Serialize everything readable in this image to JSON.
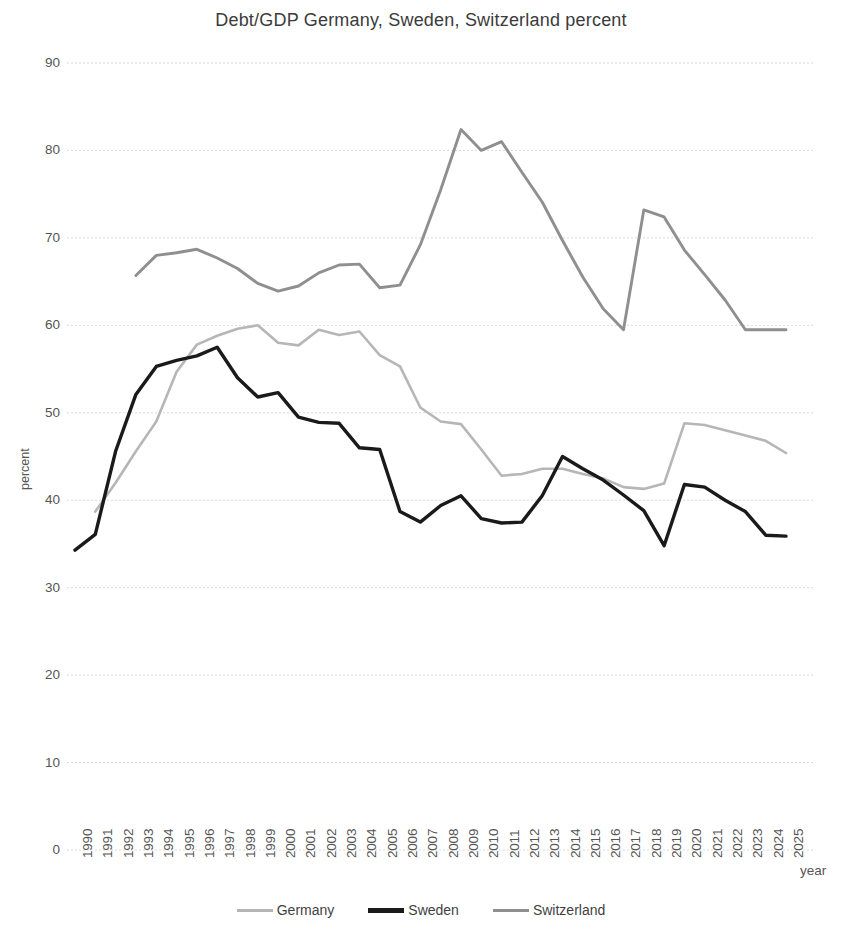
{
  "chart_data": {
    "type": "line",
    "title": "Debt/GDP Germany, Sweden, Switzerland percent",
    "xlabel": "year",
    "ylabel": "percent",
    "ylim": [
      0,
      90
    ],
    "ytick_step": 10,
    "yticks": [
      90,
      80,
      70,
      60,
      50,
      40,
      30,
      20,
      10,
      0
    ],
    "grid": true,
    "legend_position": "bottom",
    "categories": [
      "1990",
      "1991",
      "1992",
      "1993",
      "1994",
      "1995",
      "1996",
      "1997",
      "1998",
      "1999",
      "2000",
      "2001",
      "2002",
      "2003",
      "2004",
      "2005",
      "2006",
      "2007",
      "2008",
      "2009",
      "2010",
      "2011",
      "2012",
      "2013",
      "2014",
      "2015",
      "2016",
      "2017",
      "2018",
      "2019",
      "2020",
      "2021",
      "2022",
      "2023",
      "2024",
      "2025"
    ],
    "series": [
      {
        "name": "Germany",
        "color": "#b6b6b6",
        "width": 2.6,
        "values": [
          null,
          38.7,
          42.0,
          45.6,
          49.0,
          54.7,
          57.8,
          58.8,
          59.6,
          60.0,
          58.0,
          57.7,
          59.5,
          58.9,
          59.3,
          56.6,
          55.3,
          50.6,
          49.0,
          48.7,
          45.8,
          42.8,
          43.0,
          43.6,
          43.6,
          43.0,
          42.5,
          41.5,
          41.3,
          41.9,
          48.8,
          48.6,
          48.0,
          47.4,
          46.8,
          45.4
        ]
      },
      {
        "name": "Sweden",
        "color": "#1a1a1a",
        "width": 3.4,
        "values": [
          34.3,
          36.1,
          45.6,
          52.1,
          55.3,
          56.0,
          56.5,
          57.5,
          54.0,
          51.8,
          52.3,
          49.5,
          48.9,
          48.8,
          46.0,
          45.8,
          38.7,
          37.5,
          39.4,
          40.5,
          37.9,
          37.4,
          37.5,
          40.5,
          45.0,
          43.6,
          42.3,
          40.6,
          38.8,
          34.8,
          41.8,
          41.5,
          40.0,
          38.7,
          36.0,
          35.9
        ]
      },
      {
        "name": "Switzerland",
        "color": "#8f8f8f",
        "width": 2.9,
        "values": [
          null,
          null,
          null,
          65.7,
          68.0,
          68.3,
          68.7,
          67.7,
          66.5,
          64.8,
          63.9,
          64.5,
          66.0,
          66.9,
          67.0,
          64.3,
          64.6,
          69.2,
          75.5,
          82.4,
          80.0,
          81.0,
          77.5,
          74.1,
          69.7,
          65.5,
          61.9,
          59.5,
          73.2,
          72.4,
          68.6,
          65.8,
          62.9,
          59.5,
          59.5,
          59.5
        ]
      }
    ]
  },
  "axes": {
    "y_title": "percent",
    "x_title": "year"
  },
  "legend": {
    "items": [
      {
        "label": "Germany",
        "color": "#b6b6b6",
        "thickness": 3
      },
      {
        "label": "Sweden",
        "color": "#1a1a1a",
        "thickness": 5
      },
      {
        "label": "Switzerland",
        "color": "#8f8f8f",
        "thickness": 3.5
      }
    ]
  }
}
